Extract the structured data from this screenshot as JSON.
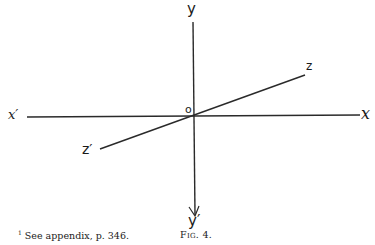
{
  "figure": {
    "caption": "Fig. 4.",
    "labels": {
      "y": "y",
      "y_prime": "y′",
      "x": "x",
      "x_prime": "x′",
      "z": "z",
      "z_prime": "z′",
      "origin": "o"
    }
  },
  "footnote": {
    "marker": "1",
    "text": "See appendix, p. 346."
  }
}
